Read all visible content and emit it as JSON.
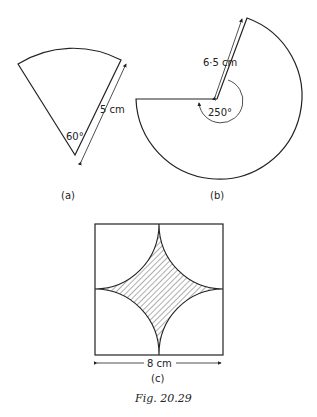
{
  "figure": {
    "caption": "Fig. 20.29",
    "panels": [
      {
        "id": "a",
        "label": "(a)",
        "shape": "sector",
        "angle_label": "60°",
        "radius_label": "5 cm"
      },
      {
        "id": "b",
        "label": "(b)",
        "shape": "sector",
        "angle_label": "250°",
        "radius_label": "6·5 cm"
      },
      {
        "id": "c",
        "label": "(c)",
        "shape": "square with four quarter-circles, shaded centre",
        "side_label": "8 cm"
      }
    ]
  },
  "colors": {
    "stroke": "#222222",
    "background": "#ffffff"
  }
}
